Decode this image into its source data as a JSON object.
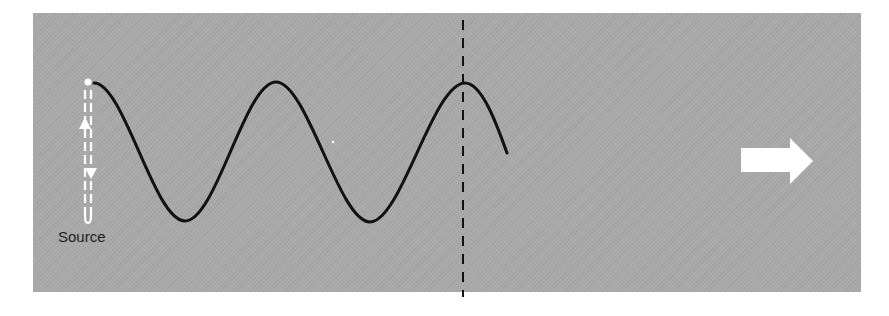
{
  "diagram": {
    "type": "traveling-wave",
    "background_color": "#a9a9a9",
    "wave_color": "#111111",
    "indicator_color": "#ffffff",
    "labels": {
      "source": "Source"
    },
    "elements": {
      "source_oscillator": {
        "description": "vertical double dashed line with up and down arrowheads showing oscillation",
        "position": {
          "x": 88,
          "y_top": 82,
          "y_bottom": 222
        }
      },
      "wave": {
        "description": "sinusoidal wave emitted from source, traveling right",
        "start": {
          "x": 94,
          "y": 83
        },
        "peaks": [
          {
            "x": 94,
            "y": 83
          },
          {
            "x": 276,
            "y": 82
          },
          {
            "x": 465,
            "y": 83
          }
        ],
        "troughs": [
          {
            "x": 185,
            "y": 221
          },
          {
            "x": 370,
            "y": 222
          }
        ],
        "end": {
          "x": 507,
          "y": 153
        },
        "wavelength_px": 185
      },
      "wavefront_marker": {
        "description": "vertical dashed line through a wave crest",
        "x": 463
      },
      "direction_arrow": {
        "description": "white block arrow pointing right indicating propagation direction",
        "direction": "right"
      }
    }
  }
}
